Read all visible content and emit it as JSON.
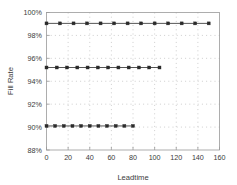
{
  "chart_data": {
    "type": "scatter",
    "title": "",
    "xlabel": "Leadtime",
    "ylabel": "Fill Rate",
    "xlim": [
      0,
      160
    ],
    "ylim": [
      88,
      100
    ],
    "grid": true,
    "grid_style": "dotted",
    "legend": "none",
    "xticks": [
      0,
      20,
      40,
      60,
      80,
      100,
      120,
      140,
      160
    ],
    "xtick_labels": [
      "0",
      "20",
      "40",
      "60",
      "80",
      "100",
      "120",
      "140",
      "160"
    ],
    "yticks": [
      88,
      90,
      92,
      94,
      96,
      98,
      100
    ],
    "ytick_labels": [
      "88%",
      "90%",
      "92%",
      "94%",
      "96%",
      "98%",
      "100%"
    ],
    "marker": "square",
    "marker_color": "#2b2b2b",
    "line_color": "#2b2b2b",
    "series": [
      {
        "name": "99% fill rate",
        "y_value": 99.05,
        "x": [
          0,
          12.5,
          25,
          37.5,
          50,
          62.5,
          75,
          87.5,
          100,
          112.5,
          125,
          137.5,
          150
        ],
        "values": [
          99.05,
          99.05,
          99.05,
          99.05,
          99.05,
          99.05,
          99.05,
          99.05,
          99.05,
          99.05,
          99.05,
          99.05,
          99.05
        ]
      },
      {
        "name": "95% fill rate",
        "y_value": 95.2,
        "x": [
          0,
          9.5,
          19,
          28.5,
          38,
          47.5,
          57,
          66.5,
          76,
          85.5,
          95,
          104.5
        ],
        "values": [
          95.2,
          95.2,
          95.2,
          95.2,
          95.2,
          95.2,
          95.2,
          95.2,
          95.2,
          95.2,
          95.2,
          95.2
        ]
      },
      {
        "name": "90% fill rate",
        "y_value": 90.1,
        "x": [
          0,
          8,
          16,
          24,
          32,
          40,
          48,
          56,
          64,
          72,
          80
        ],
        "values": [
          90.1,
          90.1,
          90.1,
          90.1,
          90.1,
          90.1,
          90.1,
          90.1,
          90.1,
          90.1,
          90.1
        ]
      }
    ],
    "colors": {
      "axis": "#9a9a9a",
      "grid": "#b9b9b9",
      "text": "#3a3a3a",
      "data": "#2b2b2b",
      "background": "#ffffff"
    }
  }
}
